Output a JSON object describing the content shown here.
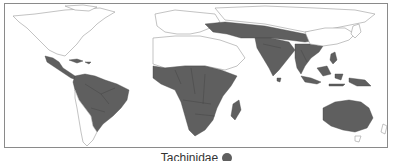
{
  "map": {
    "subject": "Tachinidae distribution",
    "range_color": "#5f5f5f",
    "land_color": "#ffffff",
    "outline_color": "#9a9a9a",
    "shaded_regions": [
      "Mexico",
      "Central America",
      "Caribbean",
      "South America (tropical)",
      "Sub-Saharan Africa",
      "Madagascar",
      "Turkey to Himalaya belt",
      "Indian subcontinent",
      "Southeast Asia",
      "Indonesia",
      "New Guinea",
      "Australia"
    ]
  },
  "legend": {
    "label": "Tachinidae",
    "swatch_color": "#5f5f5f"
  }
}
